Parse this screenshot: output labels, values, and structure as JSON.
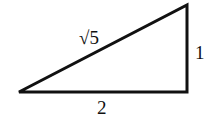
{
  "diagram": {
    "type": "right-triangle",
    "labels": {
      "hypotenuse": "√5",
      "vertical_leg": "1",
      "horizontal_leg": "2"
    },
    "stroke_color": "#111111"
  }
}
